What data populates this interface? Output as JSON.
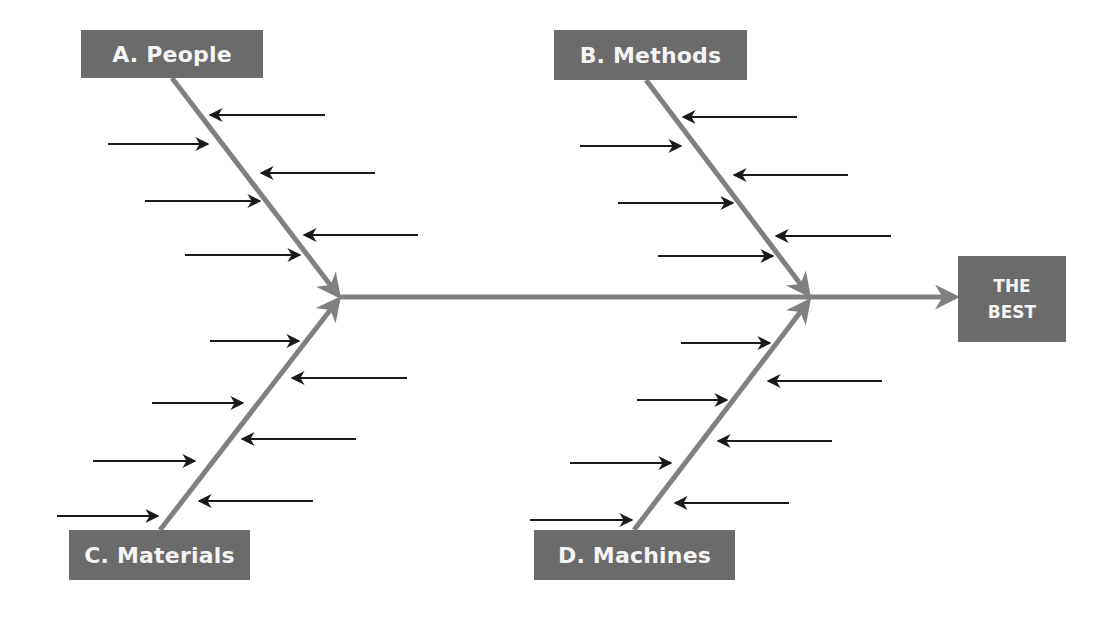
{
  "diagram": {
    "type": "fishbone",
    "colors": {
      "box_fill": "#6b6b6b",
      "box_text": "#f4f4f4",
      "bone": "#808080",
      "cause_arrow": "#1a1a1a",
      "background": "#ffffff"
    },
    "effect": {
      "line1": "THE",
      "line2": "BEST",
      "box": {
        "x": 958,
        "y": 256,
        "w": 108,
        "h": 86
      }
    },
    "spine": {
      "x1": 340,
      "y1": 297,
      "x2": 955,
      "y2": 297
    },
    "categories": [
      {
        "id": "A",
        "label": "A. People",
        "box": {
          "x": 81,
          "y": 30,
          "w": 182,
          "h": 48
        },
        "bone": {
          "x1": 172,
          "y1": 78,
          "x2": 338,
          "y2": 295
        },
        "arrows": [
          {
            "y": 115,
            "from": 325,
            "to": 210
          },
          {
            "y": 144,
            "from": 108,
            "to": 208
          },
          {
            "y": 173,
            "from": 375,
            "to": 261
          },
          {
            "y": 201,
            "from": 145,
            "to": 260
          },
          {
            "y": 235,
            "from": 418,
            "to": 304
          },
          {
            "y": 255,
            "from": 185,
            "to": 300
          }
        ]
      },
      {
        "id": "B",
        "label": "B. Methods",
        "box": {
          "x": 554,
          "y": 30,
          "w": 193,
          "h": 50
        },
        "bone": {
          "x1": 646,
          "y1": 80,
          "x2": 808,
          "y2": 294
        },
        "arrows": [
          {
            "y": 117,
            "from": 797,
            "to": 683
          },
          {
            "y": 146,
            "from": 580,
            "to": 681
          },
          {
            "y": 175,
            "from": 848,
            "to": 734
          },
          {
            "y": 203,
            "from": 618,
            "to": 733
          },
          {
            "y": 236,
            "from": 891,
            "to": 776
          },
          {
            "y": 256,
            "from": 658,
            "to": 773
          }
        ]
      },
      {
        "id": "C",
        "label": "C. Materials",
        "box": {
          "x": 69,
          "y": 530,
          "w": 181,
          "h": 50
        },
        "bone": {
          "x1": 160,
          "y1": 530,
          "x2": 338,
          "y2": 300
        },
        "arrows": [
          {
            "y": 341,
            "from": 210,
            "to": 299
          },
          {
            "y": 378,
            "from": 407,
            "to": 292
          },
          {
            "y": 403,
            "from": 152,
            "to": 243
          },
          {
            "y": 439,
            "from": 356,
            "to": 242
          },
          {
            "y": 461,
            "from": 93,
            "to": 195
          },
          {
            "y": 501,
            "from": 313,
            "to": 199
          },
          {
            "y": 516,
            "from": 57,
            "to": 158
          }
        ]
      },
      {
        "id": "D",
        "label": "D. Machines",
        "box": {
          "x": 534,
          "y": 530,
          "w": 201,
          "h": 50
        },
        "bone": {
          "x1": 634,
          "y1": 530,
          "x2": 808,
          "y2": 302
        },
        "arrows": [
          {
            "y": 343,
            "from": 681,
            "to": 770
          },
          {
            "y": 381,
            "from": 882,
            "to": 768
          },
          {
            "y": 400,
            "from": 637,
            "to": 727
          },
          {
            "y": 441,
            "from": 832,
            "to": 718
          },
          {
            "y": 463,
            "from": 570,
            "to": 671
          },
          {
            "y": 503,
            "from": 789,
            "to": 675
          },
          {
            "y": 520,
            "from": 530,
            "to": 632
          }
        ]
      }
    ]
  }
}
